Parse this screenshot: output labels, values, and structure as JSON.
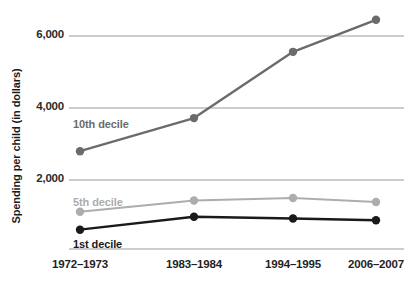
{
  "chart_data": {
    "type": "line",
    "title": "",
    "xlabel": "",
    "ylabel": "Spending per child (in dollars)",
    "categories": [
      "1972–1973",
      "1983–1984",
      "1994–1995",
      "2006–2007"
    ],
    "ylim": [
      0,
      7000
    ],
    "yticks": [
      2000,
      4000,
      6000
    ],
    "ytick_labels": [
      "2,000",
      "4,000",
      "6,000"
    ],
    "grid": "horizontal",
    "legend": "inline-labels",
    "series": [
      {
        "name": "10th decile",
        "color": "#6b6b6b",
        "values": [
          2800,
          3720,
          5560,
          6450
        ],
        "label_x_pct": 17.5,
        "label_y_px": 118
      },
      {
        "name": "5th decile",
        "color": "#adadad",
        "values": [
          1120,
          1430,
          1500,
          1390
        ],
        "label_x_pct": 17.5,
        "label_y_px": 196
      },
      {
        "name": "1st decile",
        "color": "#1a1a1a",
        "values": [
          620,
          980,
          930,
          880
        ],
        "label_x_pct": 17.5,
        "label_y_px": 238
      }
    ]
  },
  "axis": {
    "y_title": "Spending per child (in dollars)",
    "y_tick_1": "2,000",
    "y_tick_2": "4,000",
    "y_tick_3": "6,000",
    "x_tick_1": "1972–1973",
    "x_tick_2": "1983–1984",
    "x_tick_3": "1994–1995",
    "x_tick_4": "2006–2007"
  },
  "labels": {
    "tenth": "10th decile",
    "fifth": "5th decile",
    "first": "1st decile"
  },
  "colors": {
    "tenth": "#6b6b6b",
    "fifth": "#adadad",
    "first": "#1a1a1a",
    "grid": "#9a9a9a",
    "text": "#1a1a1a"
  }
}
